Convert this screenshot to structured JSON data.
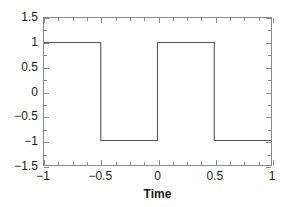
{
  "chart_data": {
    "type": "line",
    "title": "",
    "subtitle": "",
    "xlabel": "Time",
    "ylabel": "",
    "xlim": [
      -1,
      1
    ],
    "ylim": [
      -1.5,
      1.5
    ],
    "grid": false,
    "legend": null,
    "series": [
      {
        "name": "square wave",
        "color": "#555555",
        "x": [
          -1,
          -0.5,
          -0.5,
          0,
          0,
          0.5,
          0.5,
          1
        ],
        "y": [
          1,
          1,
          -1,
          -1,
          1,
          1,
          -1,
          -1
        ]
      }
    ],
    "xticks": [
      {
        "value": -1,
        "label": "−1"
      },
      {
        "value": -0.5,
        "label": "−0.5"
      },
      {
        "value": 0,
        "label": "0"
      },
      {
        "value": 0.5,
        "label": "0.5"
      },
      {
        "value": 1,
        "label": "1"
      }
    ],
    "xticks_minor": [
      -0.875,
      -0.75,
      -0.625,
      -0.375,
      -0.25,
      -0.125,
      0.125,
      0.25,
      0.375,
      0.625,
      0.75,
      0.875
    ],
    "yticks": [
      {
        "value": 1.5,
        "label": "1.5"
      },
      {
        "value": 1,
        "label": "1"
      },
      {
        "value": 0.5,
        "label": "0.5"
      },
      {
        "value": 0,
        "label": "0"
      },
      {
        "value": -0.5,
        "label": "−0.5"
      },
      {
        "value": -1,
        "label": "−1"
      },
      {
        "value": -1.5,
        "label": "−1.5"
      }
    ],
    "yticks_minor": [
      1.25,
      0.75,
      0.25,
      -0.25,
      -0.75,
      -1.25
    ],
    "axis_color": "#8a8a8a",
    "text_color": "#1a1a1a",
    "background": "#ffffff"
  }
}
